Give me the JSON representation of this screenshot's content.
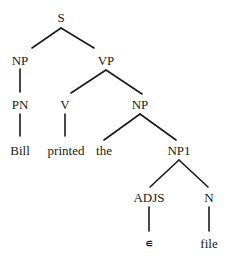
{
  "diagram": {
    "type": "parse-tree",
    "nodes": [
      {
        "id": "S",
        "label": "S",
        "x": 61,
        "y": 17
      },
      {
        "id": "NP_l",
        "label": "NP",
        "x": 20,
        "y": 60
      },
      {
        "id": "VP",
        "label": "VP",
        "x": 106,
        "y": 60
      },
      {
        "id": "PN",
        "label": "PN",
        "x": 20,
        "y": 104
      },
      {
        "id": "V",
        "label": "V",
        "x": 65,
        "y": 104
      },
      {
        "id": "NP_r",
        "label": "NP",
        "x": 140,
        "y": 104
      },
      {
        "id": "Bill",
        "label": "Bill",
        "x": 20,
        "y": 150
      },
      {
        "id": "printed",
        "label": "printed",
        "x": 66,
        "y": 150
      },
      {
        "id": "the",
        "label": "the",
        "x": 104,
        "y": 150
      },
      {
        "id": "NP1",
        "label": "NP1",
        "x": 179,
        "y": 150
      },
      {
        "id": "ADJS",
        "label": "ADJS",
        "x": 149,
        "y": 197
      },
      {
        "id": "N",
        "label": "N",
        "x": 209,
        "y": 197
      },
      {
        "id": "eps",
        "label": "∊",
        "x": 149,
        "y": 243
      },
      {
        "id": "file",
        "label": "file",
        "x": 209,
        "y": 243
      }
    ],
    "edges": [
      {
        "from": "S",
        "to": "NP_l",
        "x1": 61,
        "y1": 28,
        "x2": 32,
        "y2": 48
      },
      {
        "from": "S",
        "to": "VP",
        "x1": 61,
        "y1": 28,
        "x2": 94,
        "y2": 48
      },
      {
        "from": "NP_l",
        "to": "PN",
        "x1": 20,
        "y1": 69,
        "x2": 20,
        "y2": 92
      },
      {
        "from": "VP",
        "to": "V",
        "x1": 106,
        "y1": 70,
        "x2": 71,
        "y2": 93
      },
      {
        "from": "VP",
        "to": "NP_r",
        "x1": 106,
        "y1": 70,
        "x2": 142,
        "y2": 94
      },
      {
        "from": "PN",
        "to": "Bill",
        "x1": 20,
        "y1": 114,
        "x2": 20,
        "y2": 136
      },
      {
        "from": "V",
        "to": "printed",
        "x1": 65,
        "y1": 114,
        "x2": 65,
        "y2": 136
      },
      {
        "from": "NP_r",
        "to": "the",
        "x1": 140,
        "y1": 114,
        "x2": 104,
        "y2": 140
      },
      {
        "from": "NP_r",
        "to": "NP1",
        "x1": 140,
        "y1": 114,
        "x2": 176,
        "y2": 140
      },
      {
        "from": "NP1",
        "to": "ADJS",
        "x1": 179,
        "y1": 160,
        "x2": 150,
        "y2": 187
      },
      {
        "from": "NP1",
        "to": "N",
        "x1": 179,
        "y1": 160,
        "x2": 208,
        "y2": 187
      },
      {
        "from": "ADJS",
        "to": "eps",
        "x1": 149,
        "y1": 207,
        "x2": 149,
        "y2": 231
      },
      {
        "from": "N",
        "to": "file",
        "x1": 209,
        "y1": 207,
        "x2": 209,
        "y2": 231
      }
    ]
  }
}
